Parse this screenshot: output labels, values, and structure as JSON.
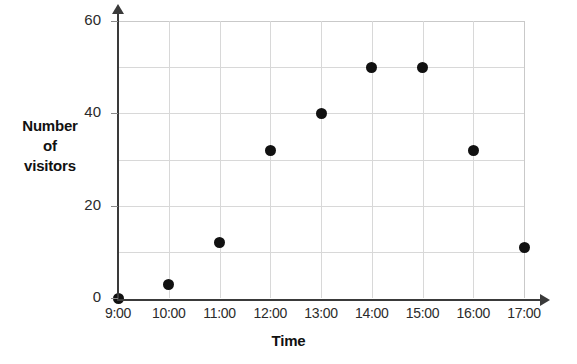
{
  "chart_data": {
    "type": "scatter",
    "title": "",
    "xlabel": "Time",
    "ylabel": "Number of visitors",
    "ylabel_lines": [
      "Number",
      "of",
      "visitors"
    ],
    "categories": [
      "9:00",
      "10:00",
      "11:00",
      "12:00",
      "13:00",
      "14:00",
      "15:00",
      "16:00",
      "17:00"
    ],
    "values": [
      0,
      3,
      12,
      32,
      40,
      50,
      50,
      32,
      11
    ],
    "points": [
      {
        "x": "9:00",
        "y": 0
      },
      {
        "x": "10:00",
        "y": 3
      },
      {
        "x": "11:00",
        "y": 12
      },
      {
        "x": "12:00",
        "y": 32
      },
      {
        "x": "13:00",
        "y": 40
      },
      {
        "x": "14:00",
        "y": 50
      },
      {
        "x": "15:00",
        "y": 50
      },
      {
        "x": "16:00",
        "y": 32
      },
      {
        "x": "17:00",
        "y": 11
      }
    ],
    "ylim": [
      0,
      60
    ],
    "y_ticks": [
      0,
      20,
      40,
      60
    ],
    "y_tick_labels": [
      "0",
      "20",
      "40",
      "60"
    ],
    "y_gridlines": [
      10,
      20,
      30,
      40,
      50,
      60
    ],
    "x_ticks": [
      "9:00",
      "10:00",
      "11:00",
      "12:00",
      "13:00",
      "14:00",
      "15:00",
      "16:00",
      "17:00"
    ],
    "grid": true,
    "legend": null,
    "marker_color": "#111111",
    "grid_color": "#d8d8d8",
    "axis_color": "#3a3a3a"
  }
}
